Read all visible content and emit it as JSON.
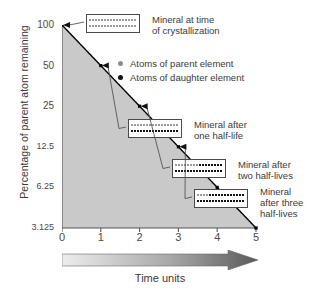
{
  "chart_data": {
    "type": "line",
    "title": "",
    "xlabel": "Time units",
    "ylabel": "Percentage of parent atom remaining",
    "x": [
      0,
      1,
      2,
      3,
      4,
      5
    ],
    "values": [
      100,
      50,
      25,
      12.5,
      6.25,
      3.125
    ],
    "yticks": [
      "100",
      "50",
      "25",
      "12.5",
      "6.25",
      "3.125"
    ],
    "ytick_values": [
      100,
      50,
      25,
      12.5,
      6.25,
      3.125
    ],
    "xticks": [
      "0",
      "1",
      "2",
      "3",
      "4",
      "5"
    ],
    "xlim": [
      0,
      5
    ],
    "ylim": [
      3.125,
      100
    ],
    "yscale": "halving (log base 2)",
    "grid": false,
    "area_fill": true,
    "area_fill_color": "#c9c9c9",
    "line_color": "#000000",
    "marker_color": "#000000",
    "legend_position": "upper-center",
    "annotations": [
      "Mineral at time of crystallization",
      "Mineral after one half-life",
      "Mineral after two half-lives",
      "Mineral after three half-lives"
    ]
  },
  "axes": {
    "y_title": "Percentage of parent atom remaining",
    "x_title": "Time units",
    "y_tick_labels": [
      "100",
      "50",
      "25",
      "12.5",
      "6.25",
      "3.125"
    ],
    "x_tick_labels": [
      "0",
      "1",
      "2",
      "3",
      "4",
      "5"
    ]
  },
  "legend": {
    "items": [
      {
        "marker": "gray-dot",
        "label": "Atoms of parent element",
        "color": "#8c8c8c"
      },
      {
        "marker": "black-dot",
        "label": "Atoms of daughter element",
        "color": "#111111"
      }
    ]
  },
  "callouts": [
    {
      "id": "crystallization",
      "line1": "Mineral at time",
      "line2": "of crystallization",
      "line3": "",
      "at_x": 0,
      "at_y": 100,
      "parent_fraction": 1.0,
      "rows": [
        {
          "total": 16,
          "parent": 16
        },
        {
          "total": 16,
          "parent": 16
        }
      ]
    },
    {
      "id": "one-half-life",
      "line1": "Mineral after",
      "line2": "one half-life",
      "line3": "",
      "at_x": 1,
      "at_y": 50,
      "parent_fraction": 0.5,
      "rows": [
        {
          "total": 16,
          "parent": 16
        },
        {
          "total": 16,
          "parent": 0
        }
      ]
    },
    {
      "id": "two-half-lives",
      "line1": "Mineral after",
      "line2": "two half-lives",
      "line3": "",
      "at_x": 2,
      "at_y": 25,
      "parent_fraction": 0.25,
      "rows": [
        {
          "total": 16,
          "parent": 8
        },
        {
          "total": 16,
          "parent": 0
        }
      ]
    },
    {
      "id": "three-half-lives",
      "line1": "Mineral",
      "line2": "after three",
      "line3": "half-lives",
      "at_x": 3,
      "at_y": 12.5,
      "parent_fraction": 0.125,
      "rows": [
        {
          "total": 16,
          "parent": 4
        },
        {
          "total": 16,
          "parent": 0
        }
      ]
    }
  ],
  "colors": {
    "area": "#c9c9c9",
    "curve": "#000000",
    "parent_dot": "#9a9a9a",
    "daughter_dot": "#111111",
    "arrow_light": "#e8e8e8",
    "arrow_dark": "#595959",
    "text": "#3a3a3a"
  }
}
